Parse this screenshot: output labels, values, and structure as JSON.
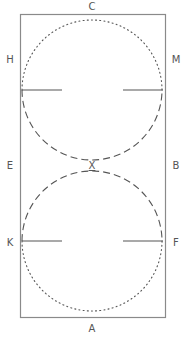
{
  "diagram": {
    "arena": {
      "x": 20,
      "y": 14,
      "width": 145,
      "height": 303,
      "stroke": "#8a8a8a"
    },
    "markers": {
      "top": "C",
      "bottom": "A",
      "left_upper": "H",
      "right_upper": "M",
      "left_middle": "E",
      "right_middle": "B",
      "left_lower": "K",
      "right_lower": "F",
      "center": "X"
    },
    "circles": [
      {
        "name": "upper-circle",
        "cx": 92,
        "cy": 90,
        "r": 70,
        "top_half": "dotted",
        "bottom_half": "dashed"
      },
      {
        "name": "lower-circle",
        "cx": 92,
        "cy": 241,
        "r": 70,
        "top_half": "dashed",
        "bottom_half": "dotted"
      }
    ],
    "colors": {
      "line": "#555555",
      "border": "#8a8a8a",
      "text": "#555555"
    }
  }
}
